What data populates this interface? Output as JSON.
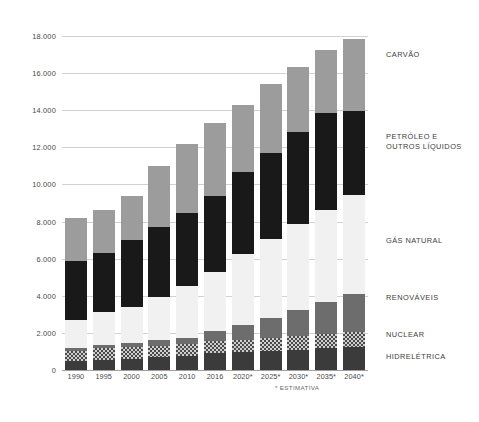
{
  "chart_data": {
    "type": "bar",
    "title": "",
    "subtitle": "",
    "xlabel": "",
    "ylabel": "",
    "stacked": true,
    "grid": true,
    "legend_position": "right",
    "ylim": [
      0,
      18000
    ],
    "yticks": [
      0,
      2000,
      4000,
      6000,
      8000,
      10000,
      12000,
      14000,
      16000,
      18000
    ],
    "ytick_labels": [
      "0",
      "2.000",
      "4.000",
      "6.000",
      "8.000",
      "10.000",
      "12.000",
      "14.000",
      "16.000",
      "18.000"
    ],
    "categories": [
      "1990",
      "1995",
      "2000",
      "2005",
      "2010",
      "2016",
      "2020*",
      "2025*",
      "2030*",
      "2035*",
      "2040*"
    ],
    "series": [
      {
        "name": "HIDRELÉTRICA",
        "color": "#3b3b3b",
        "values": [
          500,
          560,
          620,
          680,
          760,
          900,
          960,
          1020,
          1090,
          1160,
          1230
        ]
      },
      {
        "name": "NUCLEAR",
        "color": "#cfcfcf",
        "pattern": "checkered",
        "values": [
          520,
          600,
          620,
          640,
          620,
          640,
          680,
          720,
          760,
          800,
          840
        ]
      },
      {
        "name": "RENOVÁVEIS",
        "color": "#6d6d6d",
        "values": [
          160,
          180,
          220,
          280,
          360,
          560,
          760,
          1060,
          1380,
          1700,
          2000
        ]
      },
      {
        "name": "GÁS NATURAL",
        "color": "#f1f1f1",
        "values": [
          1520,
          1780,
          1940,
          2320,
          2780,
          3200,
          3860,
          4260,
          4630,
          4980,
          5350
        ]
      },
      {
        "name": "PETRÓLEO E OUTROS LÍQUIDOS",
        "color": "#191919",
        "values": [
          3180,
          3160,
          3600,
          3800,
          3960,
          4100,
          4400,
          4660,
          4950,
          5200,
          4560
        ]
      },
      {
        "name": "CARVÃO",
        "color": "#9c9c9c",
        "values": [
          2300,
          2320,
          2380,
          3280,
          3720,
          3900,
          3640,
          3720,
          3520,
          3420,
          3880
        ]
      }
    ],
    "totals": [
      8180,
      8600,
      9380,
      11000,
      12200,
      13300,
      14300,
      15440,
      16330,
      17260,
      17860
    ],
    "footnote": "* ESTIMATIVA"
  },
  "axis": {
    "y_ticks": [
      {
        "label": "18.000",
        "value": 18000
      },
      {
        "label": "16.000",
        "value": 16000
      },
      {
        "label": "14.000",
        "value": 14000
      },
      {
        "label": "12.000",
        "value": 12000
      },
      {
        "label": "10.000",
        "value": 10000
      },
      {
        "label": "8.000",
        "value": 8000
      },
      {
        "label": "6.000",
        "value": 6000
      },
      {
        "label": "4.000",
        "value": 4000
      },
      {
        "label": "2.000",
        "value": 2000
      },
      {
        "label": "0",
        "value": 0
      }
    ],
    "x_ticks": [
      "1990",
      "1995",
      "2000",
      "2005",
      "2010",
      "2016",
      "2020*",
      "2025*",
      "2030*",
      "2035*",
      "2040*"
    ]
  },
  "legend": {
    "items": [
      {
        "label": "CARVÃO",
        "lines": [
          "CARVÃO"
        ],
        "color": "#9c9c9c",
        "top": 50
      },
      {
        "label": "PETRÓLEO E OUTROS LÍQUIDOS",
        "lines": [
          "PETRÓLEO E",
          "OUTROS LÍQUIDOS"
        ],
        "color": "#191919",
        "top": 132
      },
      {
        "label": "GÁS NATURAL",
        "lines": [
          "GÁS NATURAL"
        ],
        "color": "#f1f1f1",
        "top": 236
      },
      {
        "label": "RENOVÁVEIS",
        "lines": [
          "RENOVÁVEIS"
        ],
        "color": "#6d6d6d",
        "top": 293
      },
      {
        "label": "NUCLEAR",
        "lines": [
          "NUCLEAR"
        ],
        "color": "#cfcfcf",
        "top": 330
      },
      {
        "label": "HIDRELÉTRICA",
        "lines": [
          "HIDRELÉTRICA"
        ],
        "color": "#3b3b3b",
        "top": 352
      }
    ]
  },
  "footnote": {
    "text": "* ESTIMATIVA"
  }
}
